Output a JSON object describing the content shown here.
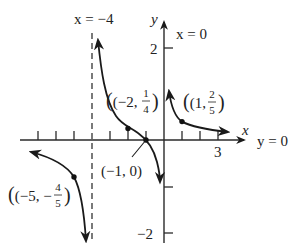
{
  "figure": {
    "function": "f(x) = (x+1)/(x(x+4))",
    "axes": {
      "x_label": "x",
      "y_label": "y",
      "x_tick_label": "3",
      "y_tick_labels": {
        "top": "2",
        "bottom": "−2"
      }
    },
    "asymptotes": {
      "vertical_left": {
        "label": "x = −4",
        "value": -4
      },
      "vertical_right": {
        "label": "x = 0",
        "value": 0
      },
      "horizontal": {
        "label": "y = 0",
        "value": 0
      }
    },
    "points": [
      {
        "name": "point-neg5",
        "label_open": "(−5, −",
        "num": "4",
        "den": "5",
        "label_close": ")",
        "x": -5,
        "y": -0.8
      },
      {
        "name": "point-neg2",
        "label_open": "(−2, ",
        "num": "1",
        "den": "4",
        "label_close": ")",
        "x": -2,
        "y": 0.25
      },
      {
        "name": "point-neg1",
        "label": "(−1, 0)",
        "x": -1,
        "y": 0
      },
      {
        "name": "point-1",
        "label_open": "(1, ",
        "num": "2",
        "den": "5",
        "label_close": ")",
        "x": 1,
        "y": 0.4
      }
    ],
    "colors": {
      "curve": "#1a1a1a",
      "axis": "#2a2a2a",
      "background": "#ffffff"
    }
  }
}
